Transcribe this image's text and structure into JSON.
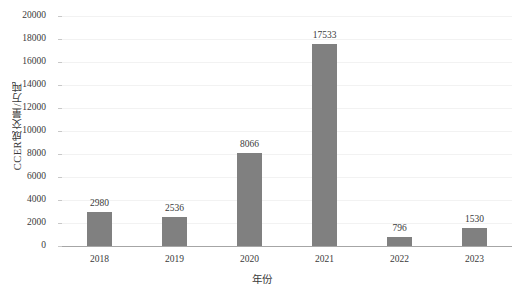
{
  "chart_data": {
    "type": "bar",
    "title": "",
    "subtitle": "",
    "xlabel": "年份",
    "ylabel": "CCER成交量/万吨",
    "categories": [
      "2018",
      "2019",
      "2020",
      "2021",
      "2022",
      "2023"
    ],
    "values": [
      2980,
      2536,
      8066,
      17533,
      796,
      1530
    ],
    "data_labels": [
      "2980",
      "2536",
      "8066",
      "17533",
      "796",
      "1530"
    ],
    "series": [
      {
        "name": "CCER成交量",
        "values": [
          2980,
          2536,
          8066,
          17533,
          796,
          1530
        ]
      }
    ],
    "ylim": [
      0,
      20000
    ],
    "ytick_step": 2000,
    "ytick_labels": [
      "0",
      "2000",
      "4000",
      "6000",
      "8000",
      "10000",
      "12000",
      "14000",
      "16000",
      "18000",
      "20000"
    ],
    "ytick_values": [
      0,
      2000,
      4000,
      6000,
      8000,
      10000,
      12000,
      14000,
      16000,
      18000,
      20000
    ],
    "grid": true,
    "grid_axis": "y",
    "legend": false,
    "legend_position": "none",
    "bar_color": "#808080",
    "gridline_color": "#f2f2f2",
    "axis_color": "#a6a6a6",
    "text_color": "#3a3a3a",
    "background_color": "#ffffff"
  }
}
